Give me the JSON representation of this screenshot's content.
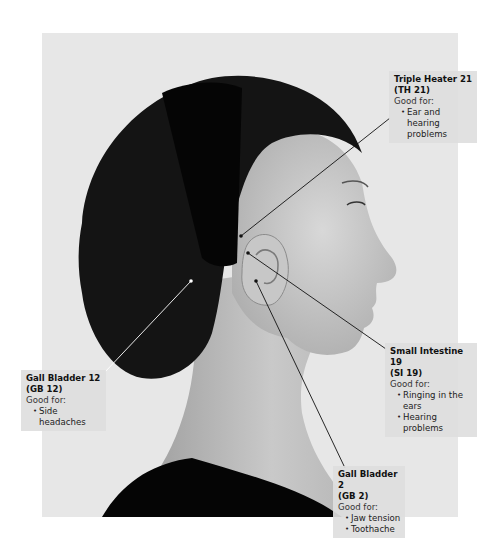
{
  "figure": {
    "background_color": "#e7e7e7"
  },
  "points": [
    {
      "id": "th21",
      "title": "Triple Heater 21",
      "code": "(TH 21)",
      "good_for_label": "Good for:",
      "benefits": [
        "Ear and hearing",
        "problems"
      ],
      "marker": {
        "x": 241,
        "y": 236,
        "color": "#111111"
      }
    },
    {
      "id": "si19",
      "title": "Small Intestine 19",
      "code": "(SI 19)",
      "good_for_label": "Good for:",
      "benefits": [
        "Ringing in the ears",
        "Hearing problems"
      ],
      "marker": {
        "x": 248,
        "y": 253,
        "color": "#111111"
      }
    },
    {
      "id": "gb12",
      "title": "Gall Bladder 12",
      "code": "(GB 12)",
      "good_for_label": "Good for:",
      "benefits": [
        "Side headaches"
      ],
      "marker": {
        "x": 191,
        "y": 281,
        "color": "#ffffff"
      }
    },
    {
      "id": "gb2",
      "title": "Gall Bladder 2",
      "code": "(GB 2)",
      "good_for_label": "Good for:",
      "benefits": [
        "Jaw tension",
        "Toothache"
      ],
      "marker": {
        "x": 256,
        "y": 281,
        "color": "#111111"
      }
    }
  ]
}
